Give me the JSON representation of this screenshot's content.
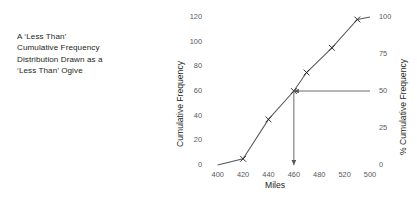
{
  "caption": {
    "lines": [
      "A ‘Less Than’",
      "Cumulative Frequency",
      "Distribution Drawn as a",
      "‘Less Than’ Ogive"
    ]
  },
  "chart_data": {
    "type": "line",
    "title": "",
    "subtitle": "",
    "xlabel": "Miles",
    "ylabel": "Cumulative Frequency",
    "ylabel_secondary": "% Cumulative Frequency",
    "xlim": [
      390,
      520
    ],
    "ylim": [
      0,
      120
    ],
    "ylim_secondary": [
      0,
      100
    ],
    "xticks": [
      400,
      420,
      440,
      460,
      480,
      520,
      500
    ],
    "xtick_labels": [
      "400",
      "420",
      "440",
      "460",
      "480",
      "520",
      "500"
    ],
    "yticks": [
      0,
      20,
      40,
      60,
      80,
      100,
      120
    ],
    "ytick_labels": [
      "0",
      "20",
      "40",
      "60",
      "80",
      "100",
      "120"
    ],
    "yticks_secondary": [
      0,
      25,
      50,
      75,
      100
    ],
    "ytick_labels_secondary": [
      "0",
      "25",
      "50",
      "75",
      "100"
    ],
    "grid": false,
    "legend": "none",
    "marker": "x",
    "line_color": "#58595b",
    "series": [
      {
        "name": "Less than cumulative frequency",
        "x": [
          400,
          420,
          440,
          460,
          470,
          490,
          510,
          520
        ],
        "values": [
          0,
          5,
          37,
          60,
          75,
          95,
          118,
          120
        ]
      }
    ],
    "annotations": [
      {
        "name": "median-horizontal-arrow",
        "type": "arrow",
        "from_x": 520,
        "from_y": 60,
        "to_x": 460,
        "to_y": 60,
        "label": ""
      },
      {
        "name": "median-vertical-arrow",
        "type": "arrow",
        "from_x": 460,
        "from_y": 60,
        "to_x": 460,
        "to_y": 0,
        "label": ""
      }
    ]
  }
}
